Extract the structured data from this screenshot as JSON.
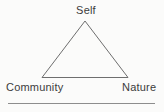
{
  "diagram": {
    "type": "triangle-relationship",
    "nodes": {
      "top": {
        "label": "Self"
      },
      "bottom_left": {
        "label": "Community"
      },
      "bottom_right": {
        "label": "Nature"
      }
    },
    "edges": [
      {
        "from": "Self",
        "to": "Community"
      },
      {
        "from": "Self",
        "to": "Nature"
      },
      {
        "from": "Community",
        "to": "Nature"
      }
    ],
    "colors": {
      "background": "#fbfbfa",
      "text": "#3c3c3c",
      "triangle_stroke": "#6e6e6e",
      "divider": "#8d8d8d"
    }
  }
}
